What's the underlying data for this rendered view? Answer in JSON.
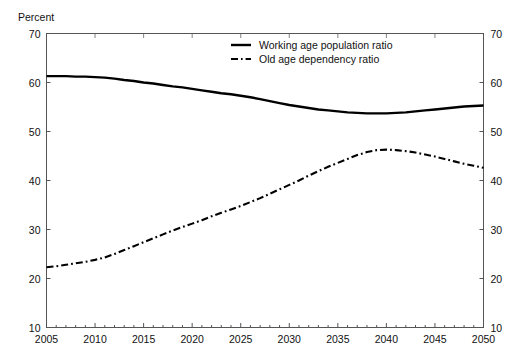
{
  "axis": {
    "unit_label": "Percent",
    "y_ticks": [
      10,
      20,
      30,
      40,
      50,
      60,
      70
    ],
    "x_ticks": [
      2005,
      2010,
      2015,
      2020,
      2025,
      2030,
      2035,
      2040,
      2045,
      2050
    ],
    "y_tick_labels": [
      "10",
      "20",
      "30",
      "40",
      "50",
      "60",
      "70"
    ],
    "x_tick_labels": [
      "2005",
      "2010",
      "2015",
      "2020",
      "2025",
      "2030",
      "2035",
      "2040",
      "2045",
      "2050"
    ]
  },
  "legend": {
    "position": "top-center",
    "items": [
      {
        "label": "Working age population ratio",
        "style": "solid",
        "color": "#000000"
      },
      {
        "label": "Old age dependency ratio",
        "style": "dashdot",
        "color": "#000000"
      }
    ]
  },
  "colors": {
    "line": "#000000",
    "frame": "#555555",
    "background": "#ffffff",
    "text": "#111111"
  },
  "chart_data": {
    "type": "line",
    "title": "",
    "subtitle": "",
    "xlabel": "",
    "ylabel": "Percent",
    "xlim": [
      2005,
      2050
    ],
    "ylim": [
      10,
      70
    ],
    "grid": false,
    "legend_position": "top-center",
    "x": [
      2005,
      2006,
      2007,
      2008,
      2009,
      2010,
      2011,
      2012,
      2013,
      2014,
      2015,
      2016,
      2017,
      2018,
      2019,
      2020,
      2021,
      2022,
      2023,
      2024,
      2025,
      2026,
      2027,
      2028,
      2029,
      2030,
      2031,
      2032,
      2033,
      2034,
      2035,
      2036,
      2037,
      2038,
      2039,
      2040,
      2041,
      2042,
      2043,
      2044,
      2045,
      2046,
      2047,
      2048,
      2049,
      2050
    ],
    "series": [
      {
        "name": "Working age population ratio",
        "style": "solid",
        "values": [
          61.3,
          61.3,
          61.3,
          61.2,
          61.2,
          61.1,
          61.0,
          60.8,
          60.5,
          60.3,
          60.0,
          59.8,
          59.5,
          59.2,
          59.0,
          58.7,
          58.4,
          58.1,
          57.8,
          57.6,
          57.3,
          57.0,
          56.6,
          56.2,
          55.8,
          55.4,
          55.1,
          54.8,
          54.5,
          54.3,
          54.1,
          53.9,
          53.8,
          53.7,
          53.7,
          53.7,
          53.8,
          53.9,
          54.1,
          54.3,
          54.5,
          54.7,
          54.9,
          55.1,
          55.2,
          55.3
        ]
      },
      {
        "name": "Old age dependency ratio",
        "style": "dashdot",
        "values": [
          22.3,
          22.5,
          22.8,
          23.1,
          23.4,
          23.8,
          24.3,
          25.0,
          25.8,
          26.6,
          27.4,
          28.2,
          29.0,
          29.8,
          30.5,
          31.2,
          31.9,
          32.7,
          33.4,
          34.1,
          34.8,
          35.6,
          36.4,
          37.3,
          38.2,
          39.1,
          40.0,
          41.0,
          41.9,
          42.8,
          43.6,
          44.4,
          45.2,
          45.8,
          46.2,
          46.3,
          46.2,
          46.0,
          45.7,
          45.3,
          44.9,
          44.4,
          43.9,
          43.4,
          43.0,
          42.6
        ]
      }
    ]
  }
}
